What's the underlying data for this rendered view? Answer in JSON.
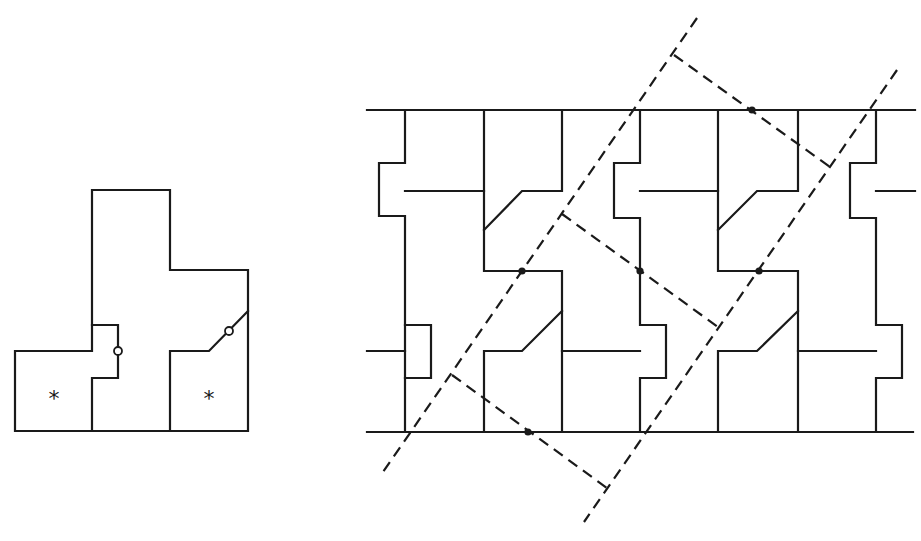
{
  "figure": {
    "colors": {
      "stroke": "#1a1a1a",
      "background": "#ffffff"
    },
    "tile": {
      "markers": [
        {
          "label": "*",
          "x": 54,
          "y": 398
        },
        {
          "label": "*",
          "x": 209,
          "y": 398
        }
      ],
      "open_circles": [
        {
          "x": 118,
          "y": 351
        },
        {
          "x": 229,
          "y": 331
        }
      ]
    },
    "tiling": {
      "filled_dots": [
        {
          "x": 752,
          "y": 110
        },
        {
          "x": 522,
          "y": 271
        },
        {
          "x": 640,
          "y": 271
        },
        {
          "x": 759,
          "y": 271
        },
        {
          "x": 528,
          "y": 432
        }
      ]
    }
  }
}
